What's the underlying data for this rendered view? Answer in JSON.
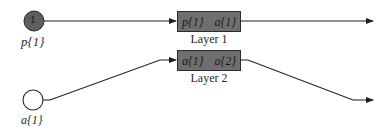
{
  "diagram": {
    "type": "recurrent-network-layer-diagram",
    "inputs": [
      {
        "id": "p1",
        "node_text": "1",
        "label": "p{1}",
        "style": "filled"
      },
      {
        "id": "a1",
        "node_text": "",
        "label": "a{1}",
        "style": "hollow"
      }
    ],
    "layers": [
      {
        "id": "layer1",
        "caption": "Layer 1",
        "input_port": "p{1}",
        "output_port": "a{1}"
      },
      {
        "id": "layer2",
        "caption": "Layer 2",
        "input_port": "a{1}",
        "output_port": "a{2}"
      }
    ],
    "edges": [
      {
        "from": "p{1}",
        "to": "Layer 1"
      },
      {
        "from": "a{1}",
        "to": "Layer 2"
      },
      {
        "from": "Layer 1",
        "to": "output-1"
      },
      {
        "from": "Layer 2",
        "to": "output-2"
      }
    ],
    "colors": {
      "node_fill": "#5e5e5e",
      "box_fill": "#6f6f6f",
      "stroke": "#1f1f1f",
      "background": "#ffffff"
    }
  }
}
